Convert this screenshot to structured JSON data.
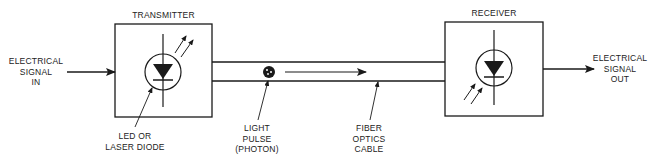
{
  "diagram": {
    "type": "fiber-optic-communication-block-diagram",
    "blocks": [
      {
        "id": "transmitter",
        "title": "TRANSMITTER",
        "component": "LED or laser diode (emitting)"
      },
      {
        "id": "receiver",
        "title": "RECEIVER",
        "component": "photodiode (receiving)"
      }
    ],
    "labels": {
      "input": [
        "ELECTRICAL",
        "SIGNAL",
        "IN"
      ],
      "transmitter_title": "TRANSMITTER",
      "receiver_title": "RECEIVER",
      "diode": [
        "LED OR",
        "LASER DIODE"
      ],
      "pulse": [
        "LIGHT",
        "PULSE",
        "(PHOTON)"
      ],
      "cable": [
        "FIBER",
        "OPTICS",
        "CABLE"
      ],
      "output": [
        "ELECTRICAL",
        "SIGNAL",
        "OUT"
      ]
    },
    "flow": [
      "ELECTRICAL SIGNAL IN",
      "TRANSMITTER",
      "FIBER OPTICS CABLE",
      "RECEIVER",
      "ELECTRICAL SIGNAL OUT"
    ],
    "colors": {
      "stroke": "#1a1a1a",
      "background": "#ffffff"
    }
  }
}
